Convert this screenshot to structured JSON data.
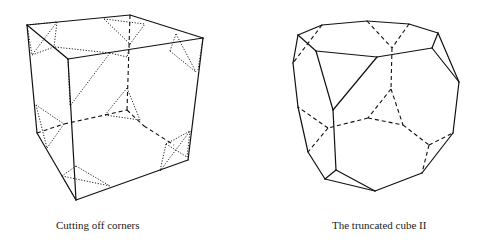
{
  "figures": [
    {
      "id": "cutting-off-corners",
      "caption": "Cutting off corners",
      "solid": [
        [
          27,
          25,
          130,
          15
        ],
        [
          130,
          15,
          203,
          38
        ],
        [
          27,
          25,
          68,
          59
        ],
        [
          68,
          59,
          203,
          38
        ],
        [
          68,
          59,
          76,
          200
        ],
        [
          203,
          38,
          188,
          160
        ],
        [
          76,
          200,
          188,
          160
        ],
        [
          27,
          25,
          37,
          133
        ],
        [
          37,
          133,
          76,
          200
        ]
      ],
      "dashed": [
        [
          130,
          15,
          127,
          110
        ],
        [
          64,
          124,
          105,
          115
        ],
        [
          105,
          115,
          127,
          110
        ],
        [
          127,
          110,
          144,
          126
        ],
        [
          144,
          126,
          174,
          145
        ],
        [
          37,
          133,
          64,
          124
        ]
      ],
      "dotted": [
        [
          27,
          25,
          57,
          22
        ],
        [
          27,
          25,
          32,
          55
        ],
        [
          57,
          22,
          32,
          55
        ],
        [
          57,
          22,
          54,
          47
        ],
        [
          32,
          55,
          54,
          47
        ],
        [
          54,
          47,
          68,
          59
        ],
        [
          104,
          19,
          130,
          44
        ],
        [
          130,
          44,
          145,
          24
        ],
        [
          104,
          19,
          145,
          24
        ],
        [
          130,
          44,
          127,
          57
        ],
        [
          127,
          57,
          110,
          53
        ],
        [
          176,
          34,
          170,
          51
        ],
        [
          176,
          34,
          196,
          72
        ],
        [
          170,
          51,
          196,
          72
        ],
        [
          198,
          70,
          203,
          38
        ],
        [
          55,
          47,
          110,
          53
        ],
        [
          110,
          53,
          70,
          106
        ],
        [
          68,
          59,
          70,
          106
        ],
        [
          127,
          88,
          105,
          115
        ],
        [
          127,
          88,
          140,
          120
        ],
        [
          105,
          115,
          140,
          120
        ],
        [
          36,
          105,
          64,
          124
        ],
        [
          36,
          105,
          47,
          148
        ],
        [
          47,
          148,
          64,
          124
        ],
        [
          166,
          144,
          190,
          131
        ],
        [
          166,
          144,
          187,
          157
        ],
        [
          190,
          131,
          187,
          157
        ],
        [
          166,
          144,
          160,
          171
        ],
        [
          160,
          171,
          190,
          131
        ],
        [
          76,
          166,
          62,
          176
        ],
        [
          62,
          176,
          110,
          186
        ],
        [
          76,
          166,
          110,
          186
        ],
        [
          62,
          176,
          76,
          200
        ]
      ]
    },
    {
      "id": "truncated-cube-ii",
      "caption": "The truncated cube II",
      "solid": [
        [
          298,
          35,
          322,
          25
        ],
        [
          322,
          25,
          367,
          21
        ],
        [
          367,
          21,
          409,
          24
        ],
        [
          409,
          24,
          438,
          33
        ],
        [
          438,
          33,
          432,
          48
        ],
        [
          432,
          48,
          377,
          57
        ],
        [
          377,
          57,
          316,
          51
        ],
        [
          316,
          51,
          298,
          35
        ],
        [
          438,
          33,
          459,
          82
        ],
        [
          432,
          48,
          459,
          82
        ],
        [
          459,
          82,
          453,
          133
        ],
        [
          453,
          133,
          422,
          173
        ],
        [
          422,
          173,
          375,
          191
        ],
        [
          298,
          35,
          293,
          63
        ],
        [
          293,
          63,
          298,
          107
        ],
        [
          298,
          107,
          308,
          152
        ],
        [
          308,
          152,
          325,
          179
        ],
        [
          316,
          51,
          333,
          110
        ],
        [
          377,
          57,
          333,
          110
        ],
        [
          333,
          110,
          336,
          170
        ],
        [
          336,
          170,
          325,
          179
        ],
        [
          336,
          170,
          375,
          191
        ],
        [
          325,
          179,
          375,
          191
        ]
      ],
      "dashed": [
        [
          322,
          25,
          293,
          63
        ],
        [
          367,
          21,
          392,
          48
        ],
        [
          409,
          24,
          392,
          48
        ],
        [
          392,
          48,
          391,
          89
        ],
        [
          391,
          89,
          368,
          118
        ],
        [
          391,
          89,
          403,
          125
        ],
        [
          368,
          118,
          403,
          125
        ],
        [
          368,
          118,
          328,
          128
        ],
        [
          328,
          128,
          298,
          107
        ],
        [
          328,
          128,
          308,
          152
        ],
        [
          403,
          125,
          429,
          145
        ],
        [
          429,
          145,
          453,
          133
        ],
        [
          429,
          145,
          422,
          173
        ]
      ],
      "dotted": []
    }
  ]
}
